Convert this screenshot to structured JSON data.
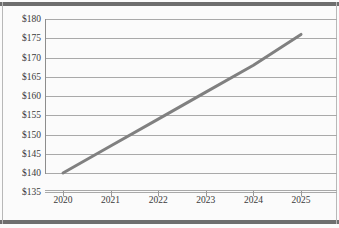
{
  "chart_data": {
    "type": "line",
    "title": "",
    "subtitle": "",
    "xlabel": "",
    "ylabel": "",
    "x": [
      "2020",
      "2021",
      "2022",
      "2023",
      "2024",
      "2025"
    ],
    "categories": [
      "2020",
      "2021",
      "2022",
      "2023",
      "2024",
      "2025"
    ],
    "series": [
      {
        "name": "",
        "values": [
          140,
          147,
          154,
          161,
          168,
          176
        ],
        "color": "#808080"
      }
    ],
    "values": [
      140,
      147,
      154,
      161,
      168,
      176
    ],
    "ylim": [
      135,
      180
    ],
    "xlim": [
      "2020",
      "2025"
    ],
    "ytick_labels": [
      "$180",
      "$175",
      "$170",
      "$165",
      "$160",
      "$155",
      "$150",
      "$145",
      "$140",
      "$135"
    ],
    "ytick_values": [
      180,
      175,
      170,
      165,
      160,
      155,
      150,
      145,
      140,
      135
    ],
    "xtick_labels": [
      "2020",
      "2021",
      "2022",
      "2023",
      "2024",
      "2025"
    ],
    "grid": "horizontal",
    "legend": "none",
    "annotations": []
  },
  "style": {
    "line_color": "#808080",
    "grid_color": "#a9a9a9",
    "axis_color": "#8d8d8d",
    "text_color": "#3a3a3a",
    "frame_color": "#6e6e6e",
    "background": "#fbfbfb"
  }
}
